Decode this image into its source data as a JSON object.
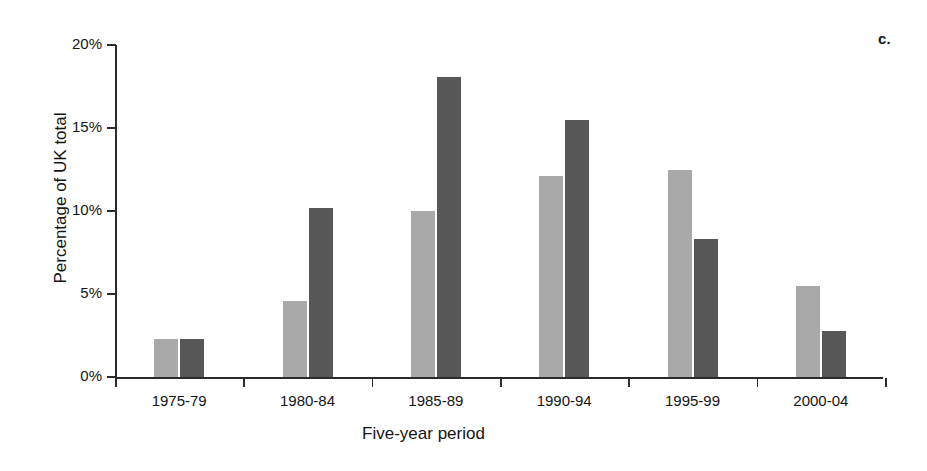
{
  "panel": {
    "letter": "c."
  },
  "chart_data": {
    "type": "bar",
    "title": "",
    "subtitle": "",
    "xlabel": "Five-year period",
    "ylabel": "Percentage of UK total",
    "categories": [
      "1975-79",
      "1980-84",
      "1985-89",
      "1990-94",
      "1995-99",
      "2000-04"
    ],
    "series": [
      {
        "name": "series-1",
        "color": "#a9a9a9",
        "values": [
          2.3,
          4.6,
          10.0,
          12.1,
          12.5,
          5.5
        ]
      },
      {
        "name": "series-2",
        "color": "#575757",
        "values": [
          2.3,
          10.2,
          18.1,
          15.5,
          8.3,
          2.8
        ]
      }
    ],
    "ylim": [
      0,
      20
    ],
    "yticks": [
      0,
      5,
      10,
      15,
      20
    ],
    "ytick_labels": [
      "0%",
      "5%",
      "10%",
      "15%",
      "20%"
    ],
    "grid": false,
    "legend": "none",
    "axis_color": "#2b2b2b"
  }
}
